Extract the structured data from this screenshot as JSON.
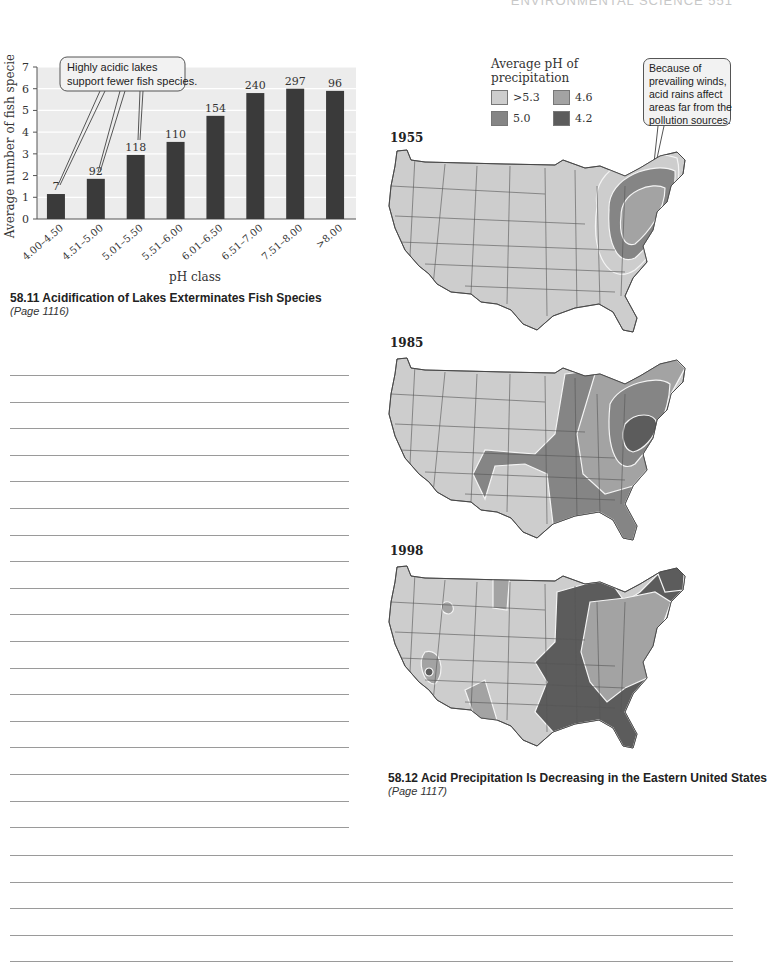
{
  "header": {
    "running_head": "ENVIRONMENTAL SCIENCE   551"
  },
  "figure_58_11": {
    "caption_title": "58.11  Acidification of Lakes Exterminates Fish Species",
    "caption_page": "(Page 1116)",
    "callout_lines": [
      "Highly acidic lakes",
      "support fewer fish species."
    ]
  },
  "figure_58_12": {
    "caption_title": "58.12  Acid Precipitation Is Decreasing in the Eastern United States",
    "caption_page": "(Page 1117)",
    "legend": {
      "title_lines": [
        "Average pH of",
        "precipitation"
      ],
      "items": [
        {
          "label": ">5.3",
          "color": "#cdcdcd"
        },
        {
          "label": "4.6",
          "color": "#a3a3a3"
        },
        {
          "label": "5.0",
          "color": "#858585"
        },
        {
          "label": "4.2",
          "color": "#5c5c5c"
        }
      ]
    },
    "callout_lines": [
      "Because of",
      "prevailing winds,",
      "acid rains affect",
      "areas far from the",
      "pollution sources."
    ],
    "maps": [
      {
        "year": "1955"
      },
      {
        "year": "1985"
      },
      {
        "year": "1998"
      }
    ]
  },
  "chart_data": {
    "type": "bar",
    "title": "Acidification of Lakes Exterminates Fish Species",
    "xlabel": "pH class",
    "ylabel": "Average number of fish species",
    "ylim": [
      0,
      7
    ],
    "yticks": [
      0,
      1,
      2,
      3,
      4,
      5,
      6,
      7
    ],
    "grid": true,
    "categories": [
      "4.00–4.50",
      "4.51–5.00",
      "5.01–5.50",
      "5.51–6.00",
      "6.01–6.50",
      "6.51–7.00",
      "7.51–8.00",
      ">8.00"
    ],
    "values": [
      1.15,
      1.85,
      2.95,
      3.55,
      4.75,
      5.8,
      6.0,
      5.9
    ],
    "data_labels": [
      "7",
      "92",
      "118",
      "110",
      "154",
      "240",
      "297",
      "96"
    ],
    "annotations": [
      "Highly acidic lakes support fewer fish species."
    ],
    "bar_color": "#3a3a3a"
  }
}
